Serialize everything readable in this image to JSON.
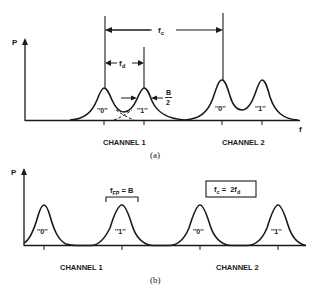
{
  "panel_a": {
    "y_axis_label": "P",
    "x_axis_label": "f",
    "dim_fc": "f",
    "dim_fc_sub": "c",
    "dim_fd": "f",
    "dim_fd_sub": "d",
    "dim_b_num": "B",
    "dim_b_den": "2",
    "peak_labels": [
      "''0''",
      "''1''",
      "''0''",
      "''1''"
    ],
    "channel_labels": [
      "CHANNEL 1",
      "CHANNEL 2"
    ],
    "caption": "(a)"
  },
  "panel_b": {
    "y_axis_label": "P",
    "bracket_label_main": "f",
    "bracket_label_sub": "FP",
    "bracket_label_rest": " = B",
    "box_label_f": "f",
    "box_label_c": "c",
    "box_label_eq": " =  2f",
    "box_label_d": "d",
    "peak_labels": [
      "''0''",
      "''1''",
      "''0''",
      "''1''"
    ],
    "channel_labels": [
      "CHANNEL 1",
      "CHANNEL 2"
    ],
    "caption": "(b)"
  }
}
